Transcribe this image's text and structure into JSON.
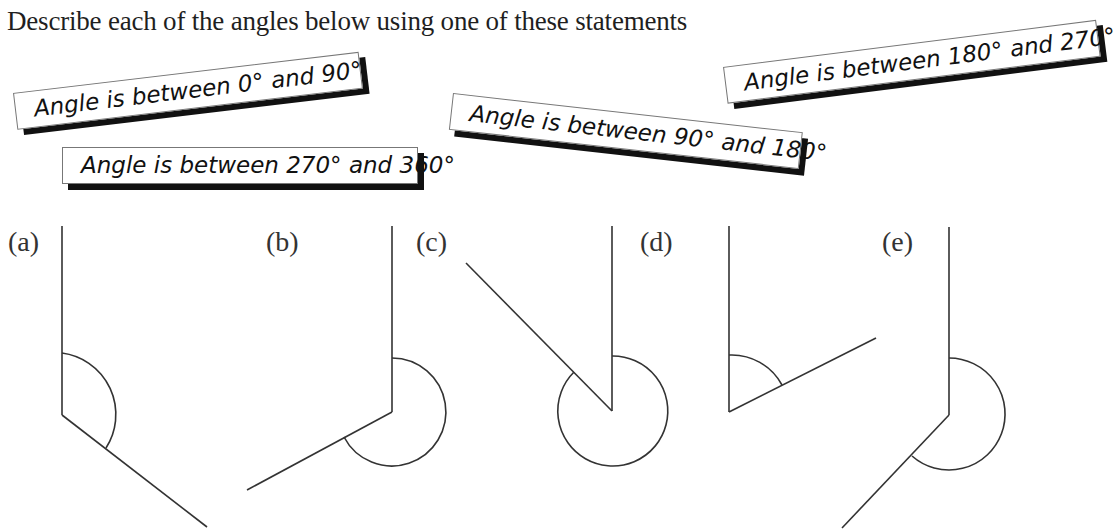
{
  "instruction": "Describe each of the angles below using one of these statements",
  "statements": [
    "Angle is between 0° and 90°",
    "Angle is between 270° and 360°",
    "Angle is between 90° and 180°",
    "Angle is between 180° and 270°"
  ],
  "angles": [
    {
      "label": "(a)"
    },
    {
      "label": "(b)"
    },
    {
      "label": "(c)"
    },
    {
      "label": "(d)"
    },
    {
      "label": "(e)"
    }
  ],
  "colors": {
    "line": "#333333",
    "card_shadow": "#111111",
    "card_border": "#777777"
  }
}
